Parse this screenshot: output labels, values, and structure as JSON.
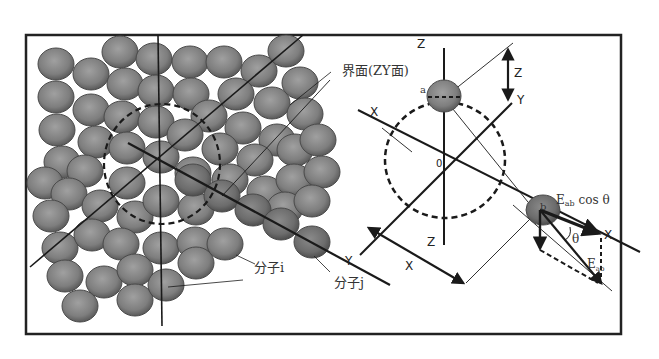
{
  "figure": {
    "colors": {
      "frame": "#222222",
      "sphere_fill": "#8a8a8a",
      "sphere_edge": "#4a4a4a",
      "line": "#1a1a1a"
    }
  },
  "left_panel": {
    "interface_label": "界面(ZY面)",
    "molecule_i_label": "分子i",
    "molecule_j_label": "分子j"
  },
  "right_panel": {
    "axis_labels": {
      "z_top": "Z",
      "z_bottom": "Z",
      "x_left": "X",
      "x_right": "X",
      "y_right": "Y",
      "y_left": "Y",
      "origin": "0"
    },
    "dimension_labels": {
      "z_distance": "Z",
      "x_distance": "X"
    },
    "molecule_a_label": "a",
    "molecule_b_label": "b",
    "force_component_label": "E",
    "force_component_sub": "ab",
    "force_component_suffix": " cos θ",
    "force_label": "E",
    "force_sub": "ab",
    "angle_label": "θ"
  }
}
